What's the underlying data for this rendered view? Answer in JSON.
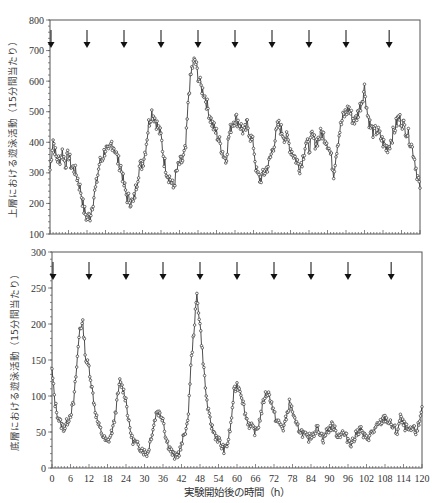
{
  "chart_data": [
    {
      "type": "line",
      "id": "upper",
      "ylabel": "上層における遊泳活動（15分間当たり）",
      "xlabel": "",
      "xlim": [
        0,
        120
      ],
      "ylim": [
        100,
        800
      ],
      "yticks": [
        100,
        200,
        300,
        400,
        500,
        600,
        700,
        800
      ],
      "grid": false,
      "markers": "open-circle",
      "arrows_at_hours": [
        0,
        12,
        24,
        36,
        48,
        60,
        72,
        84,
        96,
        110
      ],
      "series": [
        {
          "name": "upper-layer swimming activity",
          "x": [
            0,
            1,
            2,
            3,
            4,
            5,
            6,
            7,
            8,
            9,
            10,
            11,
            12,
            13,
            14,
            15,
            16,
            17,
            18,
            19,
            20,
            21,
            22,
            23,
            24,
            25,
            26,
            27,
            28,
            29,
            30,
            31,
            32,
            33,
            34,
            35,
            36,
            37,
            38,
            39,
            40,
            41,
            42,
            43,
            44,
            45,
            46,
            47,
            48,
            49,
            50,
            51,
            52,
            53,
            54,
            55,
            56,
            57,
            58,
            59,
            60,
            61,
            62,
            63,
            64,
            65,
            66,
            67,
            68,
            69,
            70,
            71,
            72,
            73,
            74,
            75,
            76,
            77,
            78,
            79,
            80,
            81,
            82,
            83,
            84,
            85,
            86,
            87,
            88,
            89,
            90,
            91,
            92,
            93,
            94,
            95,
            96,
            97,
            98,
            99,
            100,
            101,
            102,
            103,
            104,
            105,
            106,
            107,
            108,
            109,
            110,
            111,
            112,
            113,
            114,
            115,
            116,
            117,
            118,
            119,
            120
          ],
          "values": [
            310,
            410,
            350,
            340,
            370,
            330,
            360,
            320,
            310,
            280,
            240,
            180,
            150,
            160,
            210,
            260,
            330,
            350,
            380,
            360,
            400,
            380,
            340,
            320,
            260,
            220,
            210,
            200,
            260,
            320,
            330,
            380,
            460,
            500,
            480,
            450,
            420,
            340,
            300,
            280,
            250,
            300,
            330,
            340,
            380,
            560,
            640,
            670,
            620,
            580,
            560,
            520,
            480,
            450,
            430,
            400,
            370,
            340,
            420,
            460,
            480,
            470,
            450,
            430,
            460,
            420,
            390,
            300,
            280,
            290,
            310,
            330,
            370,
            410,
            460,
            440,
            420,
            410,
            380,
            360,
            340,
            320,
            350,
            400,
            380,
            420,
            400,
            410,
            430,
            420,
            400,
            360,
            300,
            380,
            440,
            480,
            500,
            510,
            480,
            470,
            500,
            530,
            580,
            490,
            450,
            430,
            440,
            420,
            400,
            380,
            390,
            420,
            450,
            480,
            470,
            450,
            430,
            400,
            360,
            300,
            250,
            220,
            200,
            200,
            210
          ],
          "note": "values estimated from plot; 120h peak region compressed"
        }
      ]
    },
    {
      "type": "line",
      "id": "lower",
      "ylabel": "底層における遊泳活動（15分間当たり）",
      "xlabel": "実験開始後の時間（h）",
      "xlim": [
        0,
        120
      ],
      "ylim": [
        0,
        300
      ],
      "yticks": [
        0,
        50,
        100,
        150,
        200,
        250,
        300
      ],
      "xticks": [
        0,
        6,
        12,
        18,
        24,
        30,
        36,
        42,
        48,
        54,
        60,
        66,
        72,
        78,
        84,
        90,
        96,
        102,
        108,
        114,
        120
      ],
      "grid": false,
      "markers": "open-circle",
      "arrows_at_hours": [
        0,
        12,
        24,
        36,
        48,
        60,
        72,
        84,
        96,
        110
      ],
      "series": [
        {
          "name": "bottom-layer swimming activity",
          "x": [
            0,
            1,
            2,
            3,
            4,
            5,
            6,
            7,
            8,
            9,
            10,
            11,
            12,
            13,
            14,
            15,
            16,
            17,
            18,
            19,
            20,
            21,
            22,
            23,
            24,
            25,
            26,
            27,
            28,
            29,
            30,
            31,
            32,
            33,
            34,
            35,
            36,
            37,
            38,
            39,
            40,
            41,
            42,
            43,
            44,
            45,
            46,
            47,
            48,
            49,
            50,
            51,
            52,
            53,
            54,
            55,
            56,
            57,
            58,
            59,
            60,
            61,
            62,
            63,
            64,
            65,
            66,
            67,
            68,
            69,
            70,
            71,
            72,
            73,
            74,
            75,
            76,
            77,
            78,
            79,
            80,
            81,
            82,
            83,
            84,
            85,
            86,
            87,
            88,
            89,
            90,
            91,
            92,
            93,
            94,
            95,
            96,
            97,
            98,
            99,
            100,
            101,
            102,
            103,
            104,
            105,
            106,
            107,
            108,
            109,
            110,
            111,
            112,
            113,
            114,
            115,
            116,
            117,
            118,
            119,
            120
          ],
          "values": [
            135,
            90,
            70,
            60,
            55,
            65,
            75,
            90,
            140,
            195,
            200,
            150,
            140,
            110,
            80,
            60,
            50,
            40,
            35,
            45,
            60,
            90,
            120,
            110,
            95,
            60,
            40,
            35,
            30,
            28,
            22,
            20,
            40,
            60,
            80,
            75,
            70,
            40,
            30,
            20,
            15,
            20,
            30,
            50,
            60,
            140,
            190,
            240,
            200,
            150,
            100,
            70,
            55,
            45,
            40,
            30,
            25,
            35,
            60,
            105,
            115,
            110,
            90,
            70,
            60,
            55,
            50,
            60,
            80,
            100,
            105,
            95,
            75,
            65,
            60,
            55,
            70,
            90,
            80,
            60,
            55,
            50,
            45,
            40,
            45,
            50,
            55,
            50,
            40,
            50,
            55,
            60,
            50,
            45,
            50,
            45,
            40,
            35,
            40,
            50,
            55,
            45,
            40,
            45,
            50,
            55,
            60,
            65,
            70,
            65,
            60,
            55,
            50,
            70,
            60,
            55,
            50,
            55,
            50,
            60,
            85
          ],
          "note": "values estimated from plot"
        }
      ]
    }
  ],
  "upper_chart": {
    "ylabel": "上層における遊泳活動（15分間当たり）",
    "yticks": [
      "100",
      "200",
      "300",
      "400",
      "500",
      "600",
      "700",
      "800"
    ]
  },
  "lower_chart": {
    "ylabel": "底層における遊泳活動（15分間当たり）",
    "yticks": [
      "0",
      "50",
      "100",
      "150",
      "200",
      "250",
      "300"
    ],
    "xticks": [
      "0",
      "6",
      "12",
      "18",
      "24",
      "30",
      "36",
      "42",
      "48",
      "54",
      "60",
      "66",
      "72",
      "78",
      "84",
      "90",
      "96",
      "102",
      "108",
      "114",
      "120"
    ],
    "xlabel": "実験開始後の時間（h）"
  },
  "icons": {
    "arrow": "down-arrow-icon"
  }
}
